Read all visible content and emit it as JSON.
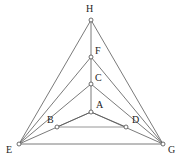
{
  "figure": {
    "type": "geometry-diagram",
    "width": 182,
    "height": 163,
    "background_color": "#ffffff",
    "edge_color": "#585858",
    "light_edge_color": "#8a8a8a",
    "vertex_fill_color": "#ffffff",
    "vertex_stroke_color": "#4a4a4a",
    "label_color": "#1d1d1d",
    "vertices": [
      {
        "id": "H",
        "label": "H",
        "x": 91,
        "y": 20,
        "label_x": 86,
        "label_y": 4
      },
      {
        "id": "F",
        "label": "F",
        "x": 91,
        "y": 57,
        "label_x": 95,
        "label_y": 46
      },
      {
        "id": "C",
        "label": "C",
        "x": 91,
        "y": 84,
        "label_x": 95,
        "label_y": 73
      },
      {
        "id": "A",
        "label": "A",
        "x": 91,
        "y": 112,
        "label_x": 96,
        "label_y": 100
      },
      {
        "id": "B",
        "label": "B",
        "x": 57,
        "y": 127,
        "label_x": 47,
        "label_y": 115
      },
      {
        "id": "D",
        "label": "D",
        "x": 126,
        "y": 127,
        "label_x": 132,
        "label_y": 115
      },
      {
        "id": "E",
        "label": "E",
        "x": 19,
        "y": 144,
        "label_x": 6,
        "label_y": 145
      },
      {
        "id": "G",
        "label": "G",
        "x": 163,
        "y": 144,
        "label_x": 168,
        "label_y": 145
      }
    ],
    "edges": [
      {
        "from": "E",
        "to": "H",
        "style": "normal"
      },
      {
        "from": "H",
        "to": "G",
        "style": "normal"
      },
      {
        "from": "E",
        "to": "F",
        "style": "normal"
      },
      {
        "from": "F",
        "to": "G",
        "style": "normal"
      },
      {
        "from": "E",
        "to": "C",
        "style": "normal"
      },
      {
        "from": "C",
        "to": "G",
        "style": "normal"
      },
      {
        "from": "E",
        "to": "A",
        "style": "normal"
      },
      {
        "from": "A",
        "to": "G",
        "style": "normal"
      },
      {
        "from": "E",
        "to": "G",
        "style": "normal"
      },
      {
        "from": "B",
        "to": "A",
        "style": "normal"
      },
      {
        "from": "A",
        "to": "D",
        "style": "normal"
      },
      {
        "from": "B",
        "to": "D",
        "style": "light"
      },
      {
        "from": "H",
        "to": "F",
        "style": "normal"
      },
      {
        "from": "F",
        "to": "C",
        "style": "normal"
      },
      {
        "from": "C",
        "to": "A",
        "style": "normal"
      }
    ],
    "vertex_radius": 2.0
  }
}
